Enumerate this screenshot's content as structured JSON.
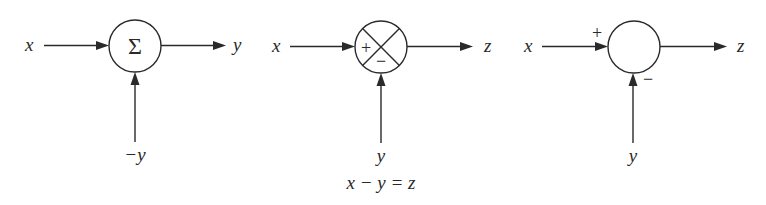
{
  "diagram": {
    "type": "summing-junction-notations",
    "blocks": [
      {
        "id": "sigma-junction",
        "symbol": "Σ",
        "inputs": [
          {
            "label": "x",
            "direction": "left"
          },
          {
            "label": "−y",
            "direction": "bottom"
          }
        ],
        "output": {
          "label": "y",
          "direction": "right"
        },
        "caption": ""
      },
      {
        "id": "cross-junction",
        "symbol": "⊗",
        "signs": {
          "left": "+",
          "bottom": "−"
        },
        "inputs": [
          {
            "label": "x",
            "direction": "left"
          },
          {
            "label": "y",
            "direction": "bottom"
          }
        ],
        "output": {
          "label": "z",
          "direction": "right"
        },
        "caption": "x − y = z"
      },
      {
        "id": "plain-junction",
        "symbol": "",
        "signs": {
          "left": "+",
          "bottom": "−"
        },
        "inputs": [
          {
            "label": "x",
            "direction": "left"
          },
          {
            "label": "y",
            "direction": "bottom"
          }
        ],
        "output": {
          "label": "z",
          "direction": "right"
        },
        "caption": ""
      }
    ]
  },
  "labels": {
    "b1_in": "x",
    "b1_out": "y",
    "b1_bottom": "−y",
    "b1_symbol": "Σ",
    "b2_in": "x",
    "b2_out": "z",
    "b2_bottom": "y",
    "b2_plus": "+",
    "b2_minus": "−",
    "b2_caption": "x − y = z",
    "b3_in": "x",
    "b3_out": "z",
    "b3_bottom": "y",
    "b3_plus": "+",
    "b3_minus": "−"
  },
  "colors": {
    "line": "#2a2a2a",
    "background": "#ffffff"
  }
}
